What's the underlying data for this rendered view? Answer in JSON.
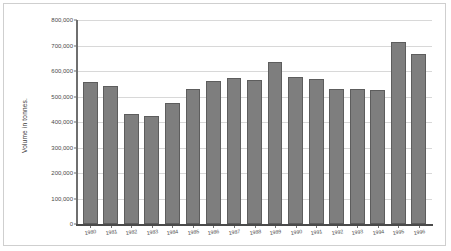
{
  "chart_data": {
    "type": "bar",
    "title": "",
    "xlabel": "",
    "ylabel": "Volume in tonnes.",
    "ylim": [
      0,
      800000
    ],
    "ytick_values": [
      0,
      100000,
      200000,
      300000,
      400000,
      500000,
      600000,
      700000,
      800000
    ],
    "ytick_labels": [
      "0",
      "100,000",
      "200,000",
      "300,000",
      "400,000",
      "500,000",
      "600,000",
      "700,000",
      "800,000"
    ],
    "grid": true,
    "legend": "none",
    "categories": [
      "1980",
      "1981",
      "1982",
      "1983",
      "1984",
      "1985",
      "1986",
      "1987",
      "1988",
      "1989",
      "1990",
      "1991",
      "1992",
      "1993",
      "1994",
      "1995",
      "1996"
    ],
    "values": [
      558000,
      542000,
      430000,
      422000,
      474000,
      530000,
      560000,
      574000,
      566000,
      634000,
      578000,
      568000,
      528000,
      528000,
      526000,
      714000,
      668000
    ]
  },
  "style": {
    "bar_color": "#7e7e7e",
    "bar_border_color": "#5d5d5d",
    "grid_color": "#d8d8d8",
    "axis_color": "#6f6f6f",
    "text_color": "#4a4a4a",
    "frame_color": "#cfcfcf",
    "background": "#ffffff"
  }
}
